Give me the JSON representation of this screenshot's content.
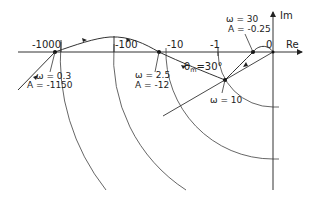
{
  "diagram": {
    "type": "Nyquist / log-polar plot",
    "axes": {
      "real_label": "Re",
      "imag_label": "Im"
    },
    "real_axis_ticks": [
      {
        "label": "-1000",
        "x": 61
      },
      {
        "label": "-100",
        "x": 114
      },
      {
        "label": "-10",
        "x": 166
      },
      {
        "label": "-1",
        "x": 218
      },
      {
        "label": "0",
        "x": 273
      }
    ],
    "annotations": {
      "point_a": {
        "omega": "ω = 0.3",
        "amplitude": "A = -1150"
      },
      "point_b": {
        "omega": "ω = 2.5",
        "amplitude": "A = -12"
      },
      "point_c": {
        "omega": "ω = 10"
      },
      "point_d": {
        "omega": "ω = 30",
        "amplitude": "A = -0.25"
      },
      "phase_margin": {
        "symbol": "θ",
        "subscript": "m",
        "value": "=30°"
      }
    },
    "colors": {
      "line": "#333333",
      "arc": "#555555",
      "background": "#ffffff"
    }
  }
}
